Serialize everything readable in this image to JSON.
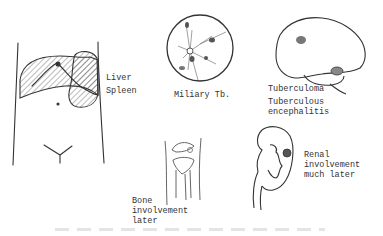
{
  "diagram": {
    "type": "medical-illustration",
    "panels": [
      {
        "id": "abdomen",
        "drawing": "abdomen-with-liver-and-spleen",
        "labels": [
          "Liver",
          "Spleen"
        ]
      },
      {
        "id": "miliary",
        "drawing": "circle-with-branching-vessels-and-nodules",
        "labels": [
          "Miliary Tb."
        ]
      },
      {
        "id": "brain",
        "drawing": "brain-with-lesions",
        "labels": [
          "Tuberculoma",
          "Tuberculous",
          "encephalitis"
        ]
      },
      {
        "id": "knee",
        "drawing": "knee-joint",
        "labels": [
          "Bone",
          "involvement",
          "later"
        ]
      },
      {
        "id": "kidney",
        "drawing": "kidney-with-lesion",
        "labels": [
          "Renal",
          "involvement",
          "much later"
        ]
      }
    ],
    "colors": {
      "ink": "#333333",
      "lesion_fill": "#777777",
      "background": "#ffffff"
    }
  }
}
